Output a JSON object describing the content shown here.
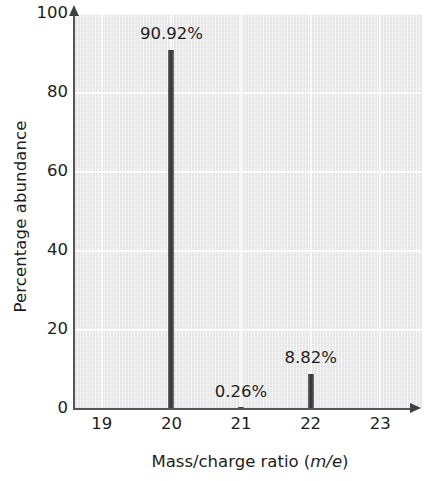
{
  "chart_data": {
    "type": "bar",
    "title": "",
    "xlabel": "Mass/charge ratio (m/e)",
    "xlabel_parts": {
      "lead": "Mass/charge ratio (",
      "italic": "m/e",
      "tail": ")"
    },
    "ylabel": "Percentage abundance",
    "categories": [
      "19",
      "20",
      "21",
      "22",
      "23"
    ],
    "x": [
      19,
      20,
      21,
      22,
      23
    ],
    "values": [
      0,
      90.92,
      0.26,
      8.82,
      0
    ],
    "data_labels": [
      "",
      "90.92%",
      "0.26%",
      "8.82%",
      ""
    ],
    "xlim": [
      18.6,
      23.6
    ],
    "ylim": [
      0,
      100
    ],
    "xticks": [
      "19",
      "20",
      "21",
      "22",
      "23"
    ],
    "yticks": [
      "0",
      "20",
      "40",
      "60",
      "80",
      "100"
    ],
    "ytick_values": [
      0,
      20,
      40,
      60,
      80,
      100
    ],
    "grid": "horizontal-and-vertical-white",
    "legend": "none",
    "plot_background": "#ececec",
    "bar_color": "#3a3a3a",
    "axis_color": "#55565a"
  }
}
